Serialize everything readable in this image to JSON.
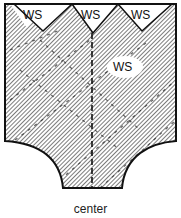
{
  "diagram": {
    "type": "sewing-pattern-piece",
    "labels": {
      "ws_top_left": "WS",
      "ws_top_middle": "WS",
      "ws_top_right": "WS",
      "ws_center": "WS"
    },
    "caption": "center",
    "colors": {
      "outline": "#111111",
      "hatch": "#333333",
      "background": "#ffffff"
    }
  }
}
